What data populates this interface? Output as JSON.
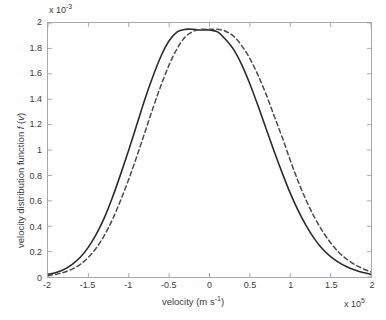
{
  "chart_data": {
    "type": "line",
    "title": "",
    "xlabel": "velocity (m s⁻¹)",
    "ylabel": "velocity distribution function f (v)",
    "x_exponent_label": "x 10",
    "x_exponent_value": "5",
    "y_exponent_label": "x 10",
    "y_exponent_value": "-3",
    "xlim": [
      -2,
      2
    ],
    "ylim": [
      0,
      2
    ],
    "x_unit_scale": 100000.0,
    "y_unit_scale": 0.001,
    "xticks": [
      "-2",
      "-1.5",
      "-1",
      "-0.5",
      "0",
      "0.5",
      "1",
      "1.5",
      "2"
    ],
    "xtick_values": [
      -2,
      -1.5,
      -1,
      -0.5,
      0,
      0.5,
      1,
      1.5,
      2
    ],
    "yticks": [
      "0",
      "0.2",
      "0.4",
      "0.6",
      "0.8",
      "1",
      "1.2",
      "1.4",
      "1.6",
      "1.8",
      "2"
    ],
    "ytick_values": [
      0,
      0.2,
      0.4,
      0.6,
      0.8,
      1,
      1.2,
      1.4,
      1.6,
      1.8,
      2
    ],
    "grid": false,
    "legend": "none",
    "axis_color": "#a8a8a8",
    "series": [
      {
        "name": "solid-distribution",
        "style": "solid",
        "color": "#2b2b2b",
        "width": 1.6,
        "peak_x": -0.02,
        "peak_y": 1.95,
        "x": [
          -2,
          -1.9,
          -1.8,
          -1.7,
          -1.6,
          -1.5,
          -1.4,
          -1.3,
          -1.2,
          -1.1,
          -1,
          -0.9,
          -0.8,
          -0.7,
          -0.6,
          -0.5,
          -0.4,
          -0.3,
          -0.2,
          -0.1,
          0,
          0.1,
          0.2,
          0.3,
          0.4,
          0.5,
          0.6,
          0.7,
          0.8,
          0.9,
          1,
          1.1,
          1.2,
          1.3,
          1.4,
          1.5,
          1.6,
          1.7,
          1.8,
          1.9,
          2
        ],
        "y": [
          0.02,
          0.035,
          0.06,
          0.1,
          0.155,
          0.235,
          0.34,
          0.47,
          0.63,
          0.81,
          1.0,
          1.2,
          1.4,
          1.58,
          1.74,
          1.86,
          1.93,
          1.95,
          1.95,
          1.945,
          1.945,
          1.93,
          1.87,
          1.79,
          1.67,
          1.52,
          1.35,
          1.17,
          0.99,
          0.82,
          0.66,
          0.52,
          0.4,
          0.3,
          0.22,
          0.16,
          0.115,
          0.08,
          0.055,
          0.035,
          0.022
        ]
      },
      {
        "name": "dashed-distribution",
        "style": "dashed",
        "color": "#4a4a4a",
        "width": 1.5,
        "peak_x": 0.12,
        "peak_y": 1.95,
        "x": [
          -2,
          -1.9,
          -1.8,
          -1.7,
          -1.6,
          -1.5,
          -1.4,
          -1.3,
          -1.2,
          -1.1,
          -1,
          -0.9,
          -0.8,
          -0.7,
          -0.6,
          -0.5,
          -0.4,
          -0.3,
          -0.2,
          -0.1,
          0,
          0.1,
          0.2,
          0.3,
          0.4,
          0.5,
          0.6,
          0.7,
          0.8,
          0.9,
          1,
          1.1,
          1.2,
          1.3,
          1.4,
          1.5,
          1.6,
          1.7,
          1.8,
          1.9,
          2
        ],
        "y": [
          0.012,
          0.022,
          0.038,
          0.062,
          0.1,
          0.155,
          0.23,
          0.33,
          0.455,
          0.605,
          0.77,
          0.95,
          1.14,
          1.33,
          1.51,
          1.67,
          1.8,
          1.89,
          1.935,
          1.95,
          1.95,
          1.95,
          1.935,
          1.895,
          1.82,
          1.72,
          1.59,
          1.44,
          1.27,
          1.1,
          0.92,
          0.75,
          0.6,
          0.47,
          0.36,
          0.27,
          0.195,
          0.14,
          0.098,
          0.065,
          0.04
        ]
      }
    ]
  },
  "axes": {
    "x_title_text": "velocity (m s",
    "x_title_sup": "-1",
    "x_title_tail": ")",
    "y_title_lead": "velocity distribution function ",
    "y_title_f": "f",
    "y_title_open": " (",
    "y_title_v": "v",
    "y_title_close": ")"
  }
}
